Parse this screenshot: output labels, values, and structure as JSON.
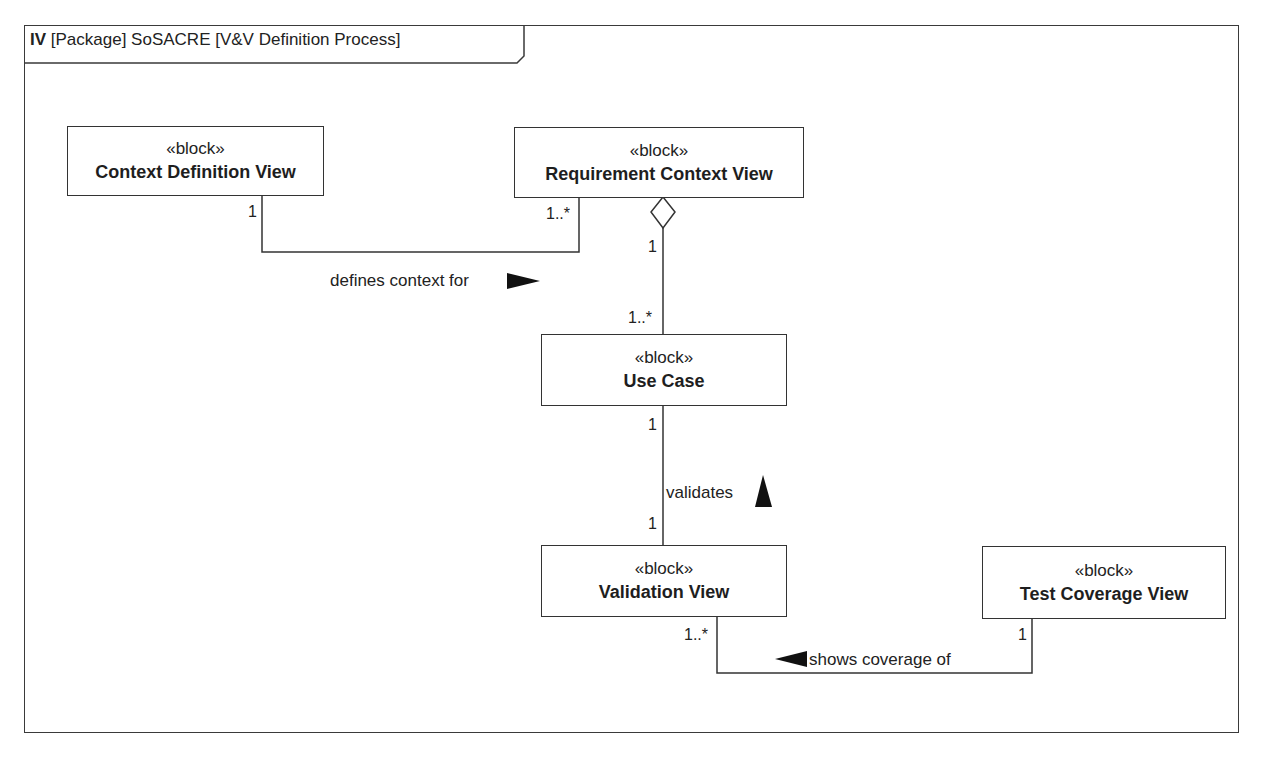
{
  "frame": {
    "kind": "IV",
    "title": "[Package] SoSACRE [V&V Definition Process]"
  },
  "blocks": [
    {
      "id": "context-definition-view",
      "stereotype": "«block»",
      "name": "Context Definition View"
    },
    {
      "id": "requirement-context-view",
      "stereotype": "«block»",
      "name": "Requirement Context View"
    },
    {
      "id": "use-case",
      "stereotype": "«block»",
      "name": "Use Case"
    },
    {
      "id": "validation-view",
      "stereotype": "«block»",
      "name": "Validation View"
    },
    {
      "id": "test-coverage-view",
      "stereotype": "«block»",
      "name": "Test Coverage View"
    }
  ],
  "associations": [
    {
      "name": "defines context for",
      "direction": "right",
      "source": "Context Definition View",
      "source_mult": "1",
      "target": "Requirement Context View",
      "target_mult": "1..*"
    },
    {
      "name": "",
      "type": "aggregation",
      "whole": "Requirement Context View",
      "whole_mult": "1",
      "part": "Use Case",
      "part_mult": "1..*"
    },
    {
      "name": "validates",
      "direction": "up",
      "source": "Validation View",
      "source_mult": "1",
      "target": "Use Case",
      "target_mult": "1"
    },
    {
      "name": "shows coverage of",
      "direction": "left",
      "source": "Test Coverage View",
      "source_mult": "1",
      "target": "Validation View",
      "target_mult": "1..*"
    }
  ]
}
